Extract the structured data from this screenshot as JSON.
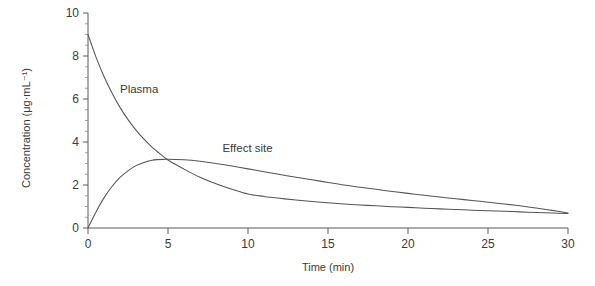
{
  "chart_data": {
    "type": "line",
    "title": "",
    "xlabel": "Time (min)",
    "ylabel": "Concentration (μg·mL⁻¹)",
    "xlim": [
      0,
      30
    ],
    "ylim": [
      0,
      10
    ],
    "xticks": [
      0,
      5,
      10,
      15,
      20,
      25,
      30
    ],
    "xtick_labels": [
      "0",
      "5",
      "10",
      "15",
      "20",
      "25",
      "30"
    ],
    "yticks": [
      0,
      2,
      4,
      6,
      8,
      10
    ],
    "ytick_labels": [
      "0",
      "2",
      "4",
      "6",
      "8",
      "10"
    ],
    "x_minor_step": 1,
    "y_minor_step": 0.5,
    "grid": false,
    "legend": "inline-annotations",
    "x": [
      0,
      0.5,
      1,
      1.5,
      2,
      2.5,
      3,
      3.5,
      4,
      4.3,
      5,
      6,
      7,
      8,
      9,
      10,
      11,
      12,
      13,
      14,
      15,
      16,
      17,
      18,
      19,
      20,
      21,
      22,
      23,
      24,
      25,
      26,
      27,
      28,
      29,
      30
    ],
    "series": [
      {
        "name": "Plasma",
        "label": "Plasma",
        "label_x": 2.0,
        "label_y": 6.3,
        "color": "#555555",
        "values": [
          9.0,
          7.95,
          7.05,
          6.28,
          5.61,
          5.04,
          4.55,
          4.13,
          3.76,
          3.57,
          3.16,
          2.74,
          2.36,
          2.06,
          1.8,
          1.58,
          1.47,
          1.38,
          1.3,
          1.23,
          1.17,
          1.12,
          1.07,
          1.03,
          0.99,
          0.96,
          0.92,
          0.89,
          0.86,
          0.83,
          0.8,
          0.78,
          0.75,
          0.72,
          0.7,
          0.67
        ]
      },
      {
        "name": "Effect site",
        "label": "Effect site",
        "label_x": 8.4,
        "label_y": 3.55,
        "color": "#555555",
        "values": [
          0.0,
          0.75,
          1.4,
          1.93,
          2.35,
          2.66,
          2.9,
          3.05,
          3.15,
          3.18,
          3.2,
          3.17,
          3.1,
          3.0,
          2.88,
          2.75,
          2.62,
          2.49,
          2.36,
          2.24,
          2.12,
          2.0,
          1.9,
          1.8,
          1.7,
          1.61,
          1.52,
          1.44,
          1.36,
          1.28,
          1.2,
          1.12,
          1.03,
          0.93,
          0.82,
          0.7
        ]
      }
    ]
  },
  "axes": {
    "y_title": "Concentration (μg·mL⁻¹)",
    "x_title": "Time (min)"
  }
}
